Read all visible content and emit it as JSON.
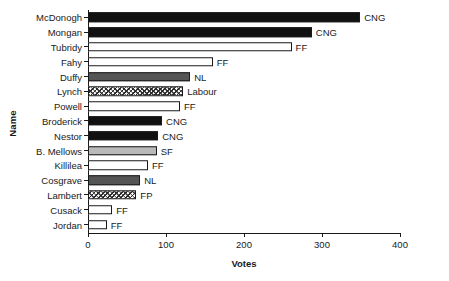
{
  "chart_data": {
    "type": "bar",
    "orientation": "horizontal",
    "title": "",
    "xlabel": "Votes",
    "ylabel": "Name",
    "xlim": [
      0,
      400
    ],
    "xticks": [
      0,
      100,
      200,
      300,
      400
    ],
    "grid": false,
    "legend": "none",
    "categories": [
      "McDonogh",
      "Mongan",
      "Tubridy",
      "Fahy",
      "Duffy",
      "Lynch",
      "Powell",
      "Broderick",
      "Nestor",
      "B. Mellows",
      "Killilea",
      "Cosgrave",
      "Lambert",
      "Cusack",
      "Jordan"
    ],
    "values": [
      349,
      287,
      261,
      160,
      131,
      122,
      118,
      95,
      90,
      88,
      77,
      67,
      62,
      31,
      24
    ],
    "annotations": [
      "CNG",
      "CNG",
      "FF",
      "FF",
      "NL",
      "Labour",
      "FF",
      "CNG",
      "CNG",
      "SF",
      "FF",
      "NL",
      "FP",
      "FF",
      "FF"
    ],
    "bars": [
      {
        "name": "McDonogh",
        "value": 349,
        "party": "CNG",
        "label": "CNG"
      },
      {
        "name": "Mongan",
        "value": 287,
        "party": "CNG",
        "label": "CNG"
      },
      {
        "name": "Tubridy",
        "value": 261,
        "party": "FF",
        "label": "FF"
      },
      {
        "name": "Fahy",
        "value": 160,
        "party": "FF",
        "label": "FF"
      },
      {
        "name": "Duffy",
        "value": 131,
        "party": "NL",
        "label": "NL"
      },
      {
        "name": "Lynch",
        "value": 122,
        "party": "Labour",
        "label": "Labour"
      },
      {
        "name": "Powell",
        "value": 118,
        "party": "FF",
        "label": "FF"
      },
      {
        "name": "Broderick",
        "value": 95,
        "party": "CNG",
        "label": "CNG"
      },
      {
        "name": "Nestor",
        "value": 90,
        "party": "CNG",
        "label": "CNG"
      },
      {
        "name": "B. Mellows",
        "value": 88,
        "party": "SF",
        "label": "SF"
      },
      {
        "name": "Killilea",
        "value": 77,
        "party": "FF",
        "label": "FF"
      },
      {
        "name": "Cosgrave",
        "value": 67,
        "party": "NL",
        "label": "NL"
      },
      {
        "name": "Lambert",
        "value": 62,
        "party": "FP",
        "label": "FP"
      },
      {
        "name": "Cusack",
        "value": 31,
        "party": "FF",
        "label": "FF"
      },
      {
        "name": "Jordan",
        "value": 24,
        "party": "FF",
        "label": "FF"
      }
    ],
    "party_fills": {
      "CNG": "#111111",
      "FF": "#ffffff",
      "NL": "#555555",
      "SF": "#b9b9b9",
      "Labour": "#ffffff",
      "FP": "#ffffff"
    }
  }
}
